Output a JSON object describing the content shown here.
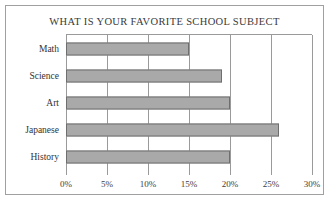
{
  "chart_data": {
    "type": "bar",
    "orientation": "horizontal",
    "title": "WHAT IS YOUR FAVORITE SCHOOL SUBJECT",
    "xlabel": "",
    "ylabel": "",
    "categories": [
      "Math",
      "Science",
      "Art",
      "Japanese",
      "History"
    ],
    "values": [
      15,
      19,
      20,
      26,
      20
    ],
    "value_unit": "%",
    "xlim": [
      0,
      30
    ],
    "xticks": [
      0,
      5,
      10,
      15,
      20,
      25,
      30
    ],
    "xtick_labels": [
      "0%",
      "5%",
      "10%",
      "15%",
      "20%",
      "25%",
      "30%"
    ],
    "grid": "vertical",
    "legend": null,
    "colors": {
      "bar_fill": "#a9a9a9",
      "bar_border": "#6e6e6e",
      "gridline": "#9a9a9a",
      "frame": "#a0a0a0",
      "background": "#ffffff",
      "text": "#333333"
    }
  }
}
